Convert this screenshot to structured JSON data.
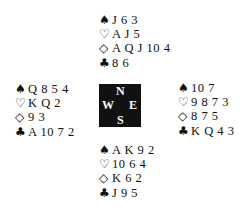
{
  "suits": {
    "spades": "♠",
    "hearts": "♡",
    "diamonds": "◇",
    "clubs": "♣"
  },
  "compass": {
    "north": "N",
    "south": "S",
    "west": "W",
    "east": "E"
  },
  "hands": {
    "north": {
      "spades": "J 6 3",
      "hearts": "A J 5",
      "diamonds": "A Q J 10 4",
      "clubs": "8 6"
    },
    "west": {
      "spades": "Q 8 5 4",
      "hearts": "K Q 2",
      "diamonds": "9 3",
      "clubs": "A 10 7 2"
    },
    "east": {
      "spades": "10 7",
      "hearts": "9 8 7 3",
      "diamonds": "8 7 5",
      "clubs": "K Q 4 3"
    },
    "south": {
      "spades": "A K 9 2",
      "hearts": "10 6 4",
      "diamonds": "K 6 2",
      "clubs": "J 9 5"
    }
  }
}
